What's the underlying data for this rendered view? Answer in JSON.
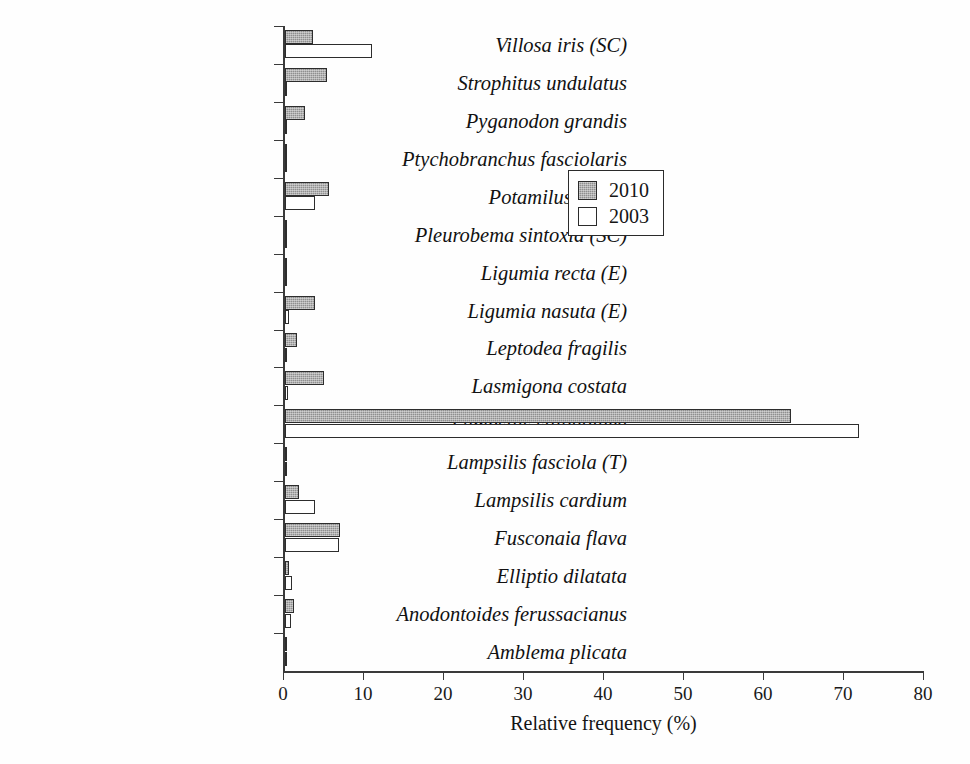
{
  "chart_data": {
    "type": "bar",
    "orientation": "horizontal",
    "title": "",
    "xlabel": "Relative frequency (%)",
    "ylabel": "",
    "xlim": [
      0,
      80
    ],
    "xticks": [
      0,
      10,
      20,
      30,
      40,
      50,
      60,
      70,
      80
    ],
    "grid": false,
    "legend_position": "upper-center",
    "categories": [
      "Villosa iris (SC)",
      "Strophitus undulatus",
      "Pyganodon grandis",
      "Ptychobranchus fasciolaris",
      "Potamilus alatus",
      "Pleurobema sintoxia (SC)",
      "Ligumia recta (E)",
      "Ligumia nasuta (E)",
      "Leptodea fragilis",
      "Lasmigona costata",
      "Lampsilis siliquoidea",
      "Lampsilis fasciola (T)",
      "Lampsilis cardium",
      "Fusconaia flava",
      "Elliptio dilatata",
      "Anodontoides ferussacianus",
      "Amblema plicata"
    ],
    "series": [
      {
        "name": "2010",
        "fill": "gray-hatched",
        "values": [
          3.5,
          5.2,
          2.5,
          0.2,
          5.5,
          0.3,
          0.3,
          3.8,
          1.5,
          4.9,
          63.2,
          0.3,
          1.8,
          6.9,
          0.5,
          1.1,
          0.2
        ]
      },
      {
        "name": "2003",
        "fill": "white",
        "values": [
          10.9,
          0.2,
          0.3,
          0.0,
          3.8,
          0.0,
          0.0,
          0.5,
          0.0,
          0.4,
          71.7,
          0.0,
          3.8,
          6.7,
          0.9,
          0.7,
          0.0
        ]
      }
    ]
  },
  "legend": {
    "entries": [
      {
        "label": "2010",
        "swatch": "gray-hatched"
      },
      {
        "label": "2003",
        "swatch": "white"
      }
    ]
  },
  "axis": {
    "x_title": "Relative frequency (%)",
    "tick_labels": [
      "0",
      "10",
      "20",
      "30",
      "40",
      "50",
      "60",
      "70",
      "80"
    ]
  },
  "colors": {
    "bar_2010_fill": "#8f8f8f",
    "bar_2003_fill": "#ffffff",
    "bar_outline": "#2d2d2d",
    "axis": "#3a3a3a",
    "text": "#141414",
    "background": "#ffffff"
  },
  "caption": {
    "partial_text": ""
  }
}
